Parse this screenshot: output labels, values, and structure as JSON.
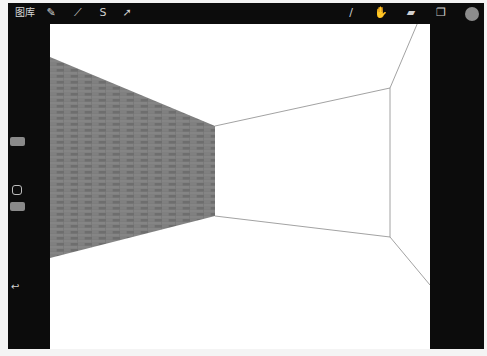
{
  "app": {
    "gallery_label": "图库",
    "left_tools": [
      {
        "name": "actions-icon",
        "glyph": "✎"
      },
      {
        "name": "adjustments-icon",
        "glyph": "⟋"
      },
      {
        "name": "selection-icon",
        "glyph": "S"
      },
      {
        "name": "transform-icon",
        "glyph": "➚"
      }
    ],
    "right_tools": [
      {
        "name": "brush-icon",
        "glyph": "/"
      },
      {
        "name": "smudge-icon",
        "glyph": "✋"
      },
      {
        "name": "eraser-icon",
        "glyph": "▰"
      },
      {
        "name": "layers-icon",
        "glyph": "❐"
      }
    ],
    "color": "#8c8c8c"
  },
  "sidebar": {
    "undo_glyph": "↩"
  },
  "canvas": {
    "drawing": "one-point perspective room with brick-textured left wall",
    "wall_texture_color": "#7a7a7a",
    "line_color": "#8a8a8a"
  }
}
